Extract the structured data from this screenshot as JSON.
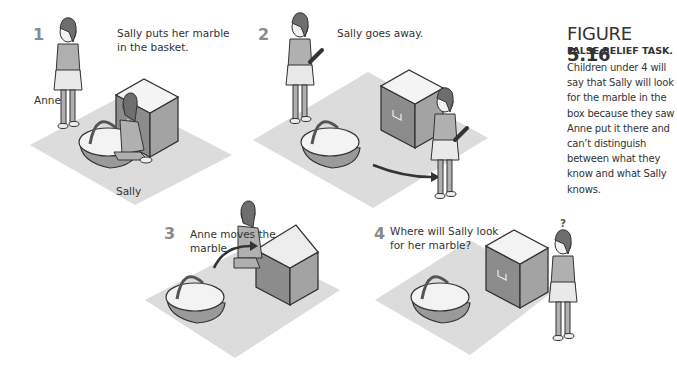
{
  "figure": {
    "label": "FIGURE",
    "number": "5.16",
    "title": "FALSE BELIEF TASK.",
    "description": "Children under 4 will say that Sally will look for the marble in the box because they saw Anne put it there and can’t distinguish between what they know and what Sally knows."
  },
  "panels": [
    {
      "number": "1",
      "caption_line1": "Sally puts her marble",
      "caption_line2": "in the basket.",
      "labels": {
        "anne": "Anne",
        "sally": "Sally"
      }
    },
    {
      "number": "2",
      "caption_line1": "Sally goes away."
    },
    {
      "number": "3",
      "caption_line1": "Anne moves the",
      "caption_line2": "marble."
    },
    {
      "number": "4",
      "caption_line1": "Where will Sally look",
      "caption_line2": "for her marble?",
      "question_mark": "?"
    }
  ],
  "colors": {
    "floor": "#dcdcdc",
    "box_side_dark": "#8c8c8c",
    "box_side_light": "#a8a8a8",
    "box_top": "#f4f4f4",
    "figure_dress": "#b0b0b0",
    "outline": "#333333",
    "panel_number": "#8a8a8a"
  }
}
